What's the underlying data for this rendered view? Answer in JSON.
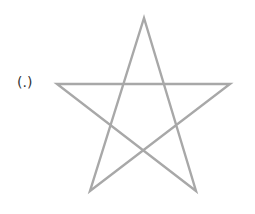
{
  "label": {
    "text": "(.)"
  },
  "figure": {
    "shape": "pentagram",
    "stroke_color": "#a8a8a8",
    "stroke_width": 2.4,
    "vertices": {
      "top": [
        144,
        18
      ],
      "left": [
        57,
        84
      ],
      "right": [
        230,
        84
      ],
      "bottom_left": [
        90,
        191
      ],
      "bottom_right": [
        196,
        191
      ]
    }
  }
}
